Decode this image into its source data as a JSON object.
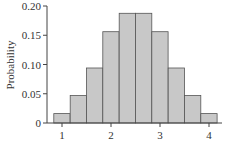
{
  "chart_data": {
    "type": "bar",
    "title": "",
    "xlabel": "",
    "ylabel": "Probability",
    "x": [
      1.0,
      1.333,
      1.667,
      2.0,
      2.333,
      2.667,
      3.0,
      3.333,
      3.667,
      4.0
    ],
    "values": [
      0.016,
      0.047,
      0.094,
      0.156,
      0.1875,
      0.1875,
      0.156,
      0.094,
      0.047,
      0.016
    ],
    "ylim": [
      0,
      0.2
    ],
    "xlim": [
      0.85,
      4.2
    ],
    "yticks": [
      0,
      0.05,
      0.1,
      0.15,
      0.2
    ],
    "ytick_labels": [
      "0",
      "0.05",
      "0.10",
      "0.15",
      "0.20"
    ],
    "xticks": [
      1,
      2,
      3,
      4
    ],
    "xtick_labels": [
      "1",
      "2",
      "3",
      "4"
    ],
    "grid": false,
    "legend": null,
    "bar_color": "#c8c8c8",
    "edge_color": "#555555"
  }
}
